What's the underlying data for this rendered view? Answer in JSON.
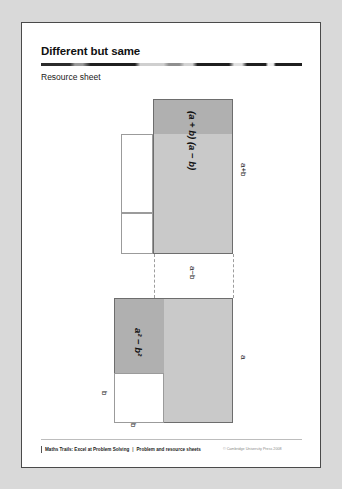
{
  "page": {
    "title": "Different but same",
    "subtitle": "Resource sheet"
  },
  "diagram": {
    "top_figure": {
      "area_label": "(a + b) (a − b)",
      "height_label": "a+b",
      "width_label": "a−b"
    },
    "bottom_figure": {
      "area_label": "a² − b²",
      "side_label_right": "a",
      "side_label_left": "b",
      "side_label_bottom": "b"
    }
  },
  "footer": {
    "book_title": "Maths Trails: Excel at Problem Solving",
    "separator": "|",
    "section": "Problem and resource sheets",
    "copyright": "© Cambridge University Press 2008"
  },
  "colors": {
    "page_background": "#d9d9d9",
    "sheet": "#ffffff",
    "rule": "#1f1f1f",
    "fill_light": "#c9c9c9",
    "fill_dark": "#b0b0b0",
    "outline": "#6d6d6d",
    "text": "#111111"
  }
}
